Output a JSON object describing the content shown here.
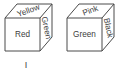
{
  "figure": {
    "type": "line-drawing",
    "stroke_color": "#4a4a4a",
    "text_color": "#3d3d3d",
    "background_color": "#ffffff"
  },
  "cubes": [
    {
      "id": "cube-1",
      "numeral": "I",
      "faces": {
        "front": "Red",
        "top": "Yellow",
        "right": "Green"
      }
    },
    {
      "id": "cube-2",
      "numeral": "II",
      "faces": {
        "front": "Green",
        "top": "Pink",
        "right": "Black"
      }
    }
  ]
}
